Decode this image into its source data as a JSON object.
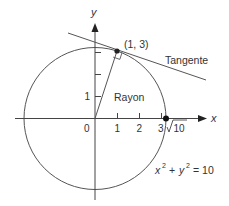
{
  "diagram": {
    "type": "circle-tangent",
    "equation": {
      "lhs_x": "x",
      "lhs_y": "y",
      "exp": "2",
      "text": "x² + y² = 10",
      "rhs": "= 10",
      "plus": "+"
    },
    "axes": {
      "x_label": "x",
      "y_label": "y"
    },
    "ticks": {
      "origin": "0",
      "x": [
        "1",
        "2",
        "3"
      ],
      "y": [
        "1"
      ]
    },
    "point_label": "(1, 3)",
    "radius_label": "Rayon",
    "tangent_label": "Tangente",
    "intercept_label": "10",
    "colors": {
      "stroke": "#444444",
      "text": "#333333",
      "background": "#ffffff"
    }
  }
}
